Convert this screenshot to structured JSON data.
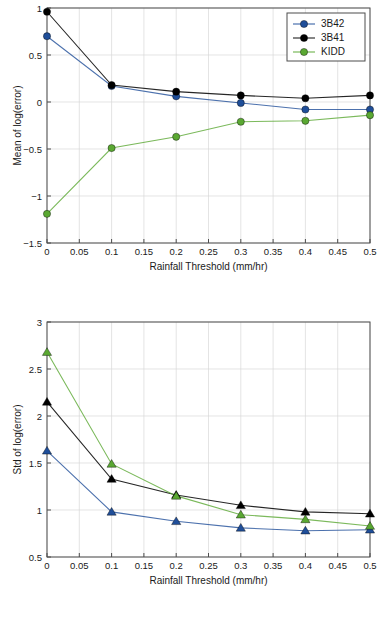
{
  "chart_data": [
    {
      "id": "mean-log-error",
      "type": "line",
      "title": "",
      "xlabel": "Rainfall Threshold (mm/hr)",
      "ylabel": "Mean of log(error)",
      "x": [
        0,
        0.1,
        0.2,
        0.3,
        0.4,
        0.5
      ],
      "xlim": [
        0,
        0.5
      ],
      "ylim": [
        -1.5,
        1
      ],
      "xticks": [
        0,
        0.05,
        0.1,
        0.15,
        0.2,
        0.25,
        0.3,
        0.35,
        0.4,
        0.45,
        0.5
      ],
      "xticklabels": [
        "0",
        "0.05",
        "0.1",
        "0.15",
        "0.2",
        "0.25",
        "0.3",
        "0.35",
        "0.4",
        "0.45",
        "0.5"
      ],
      "yticks": [
        -1.5,
        -1,
        -0.5,
        0,
        0.5,
        1
      ],
      "yticklabels": [
        "-1.5",
        "-1",
        "-0.5",
        "0",
        "0.5",
        "1"
      ],
      "grid": true,
      "marker": "circle",
      "legend": {
        "position": "top-right",
        "entries": [
          "3B42",
          "3B41",
          "KIDD"
        ]
      },
      "series": [
        {
          "name": "3B42",
          "color": "#1f4e99",
          "values": [
            0.7,
            0.17,
            0.06,
            -0.01,
            -0.08,
            -0.08
          ]
        },
        {
          "name": "3B41",
          "color": "#000000",
          "values": [
            0.96,
            0.18,
            0.11,
            0.07,
            0.04,
            0.07
          ]
        },
        {
          "name": "KIDD",
          "color": "#5aa832",
          "values": [
            -1.19,
            -0.49,
            -0.37,
            -0.21,
            -0.2,
            -0.14
          ]
        }
      ]
    },
    {
      "id": "std-log-error",
      "type": "line",
      "title": "",
      "xlabel": "Rainfall Threshold (mm/hr)",
      "ylabel": "Std of log(error)",
      "x": [
        0,
        0.1,
        0.2,
        0.3,
        0.4,
        0.5
      ],
      "xlim": [
        0,
        0.5
      ],
      "ylim": [
        0.5,
        3
      ],
      "xticks": [
        0,
        0.05,
        0.1,
        0.15,
        0.2,
        0.25,
        0.3,
        0.35,
        0.4,
        0.45,
        0.5
      ],
      "xticklabels": [
        "0",
        "0.05",
        "0.1",
        "0.15",
        "0.2",
        "0.25",
        "0.3",
        "0.35",
        "0.4",
        "0.45",
        "0.5"
      ],
      "yticks": [
        0.5,
        1,
        1.5,
        2,
        2.5,
        3
      ],
      "yticklabels": [
        "0.5",
        "1",
        "1.5",
        "2",
        "2.5",
        "3"
      ],
      "grid": true,
      "marker": "triangle",
      "legend": null,
      "series": [
        {
          "name": "3B42",
          "color": "#1f4e99",
          "values": [
            1.63,
            0.98,
            0.88,
            0.81,
            0.78,
            0.79
          ]
        },
        {
          "name": "3B41",
          "color": "#000000",
          "values": [
            2.15,
            1.33,
            1.16,
            1.05,
            0.98,
            0.96
          ]
        },
        {
          "name": "KIDD",
          "color": "#5aa832",
          "values": [
            2.68,
            1.49,
            1.15,
            0.95,
            0.9,
            0.83
          ]
        }
      ]
    }
  ]
}
